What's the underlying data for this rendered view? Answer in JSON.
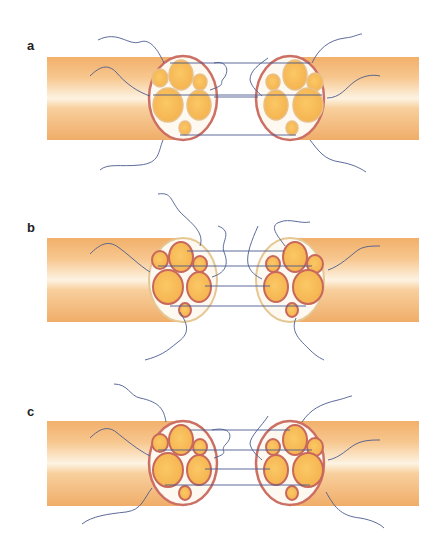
{
  "figure": {
    "panels": [
      {
        "label": "a",
        "technique": "epineurial suture",
        "top": 57
      },
      {
        "label": "b",
        "technique": "fascicular (perineurial) suture",
        "top": 238
      },
      {
        "label": "c",
        "technique": "combined epi-perineurial suture",
        "top": 421
      }
    ]
  },
  "colors": {
    "nerve_outer": "#f3b774",
    "nerve_highlight": "#fdf1dc",
    "epineurium": "#cc6f64",
    "epineurium_b": "#e5c793",
    "fascicle_fill": "#f7c05a",
    "fascicle_ring": "#e8c08a",
    "fascicle_ring_b": "#c8685c",
    "suture": "#4a5a8f",
    "inner_bg": "#fdf8f0"
  }
}
